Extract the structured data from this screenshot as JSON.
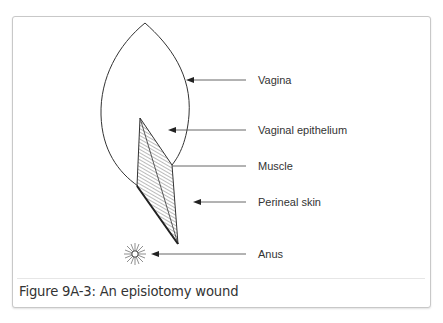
{
  "figure": {
    "caption": "Figure 9A-3: An episiotomy wound",
    "labels": [
      {
        "id": "vagina",
        "text": "Vagina"
      },
      {
        "id": "vaginal-epithelium",
        "text": "Vaginal epithelium"
      },
      {
        "id": "muscle",
        "text": "Muscle"
      },
      {
        "id": "perineal-skin",
        "text": "Perineal skin"
      },
      {
        "id": "anus",
        "text": "Anus"
      }
    ]
  },
  "colors": {
    "stroke": "#333333",
    "leader": "#555555",
    "frame_border": "#c8c8c8",
    "separator": "#e6e6e6"
  }
}
